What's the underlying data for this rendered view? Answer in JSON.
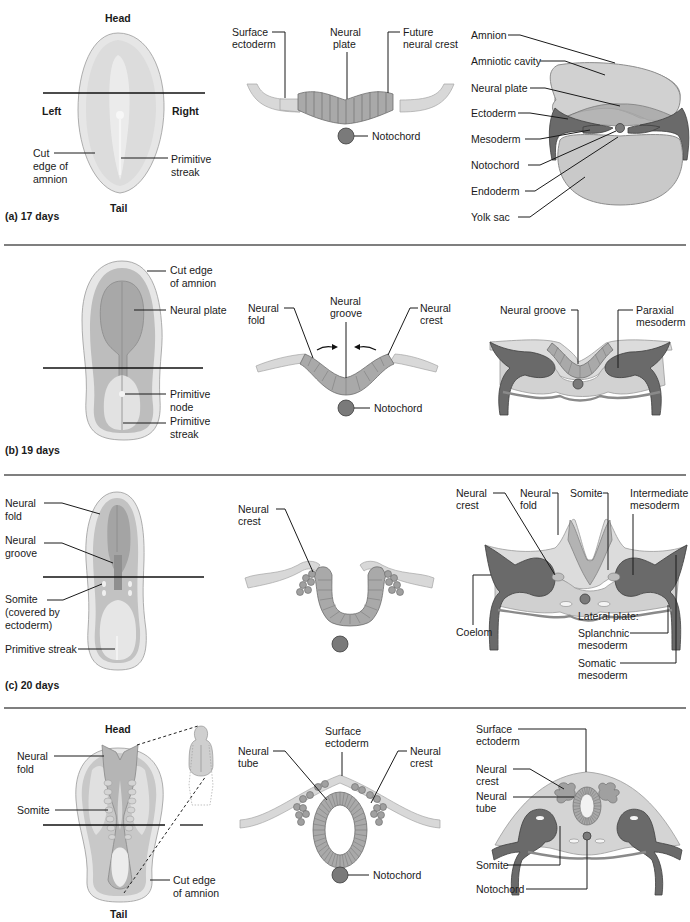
{
  "figure": {
    "panels": [
      {
        "id": "a",
        "caption": "(a) 17 days",
        "dorsal_view": {
          "head": "Head",
          "tail": "Tail",
          "left": "Left",
          "right": "Right",
          "labels": [
            "Cut",
            "edge of",
            "amnion",
            "Primitive",
            "streak"
          ]
        },
        "neural_section": {
          "labels": [
            "Surface",
            "ectoderm",
            "Neural",
            "plate",
            "Future",
            "neural crest",
            "Notochord"
          ]
        },
        "cross_section": {
          "labels": [
            "Amnion",
            "Amniotic cavity",
            "Neural plate",
            "Ectoderm",
            "Mesoderm",
            "Notochord",
            "Endoderm",
            "Yolk sac"
          ]
        }
      },
      {
        "id": "b",
        "caption": "(b) 19 days",
        "dorsal_view": {
          "labels": [
            "Cut edge",
            "of amnion",
            "Neural plate",
            "Primitive",
            "node",
            "Primitive",
            "streak"
          ]
        },
        "neural_section": {
          "labels": [
            "Neural",
            "fold",
            "Neural",
            "groove",
            "Neural",
            "crest",
            "Notochord"
          ]
        },
        "cross_section": {
          "labels": [
            "Neural groove",
            "Paraxial",
            "mesoderm"
          ]
        }
      },
      {
        "id": "c",
        "caption": "(c) 20 days",
        "dorsal_view": {
          "labels": [
            "Neural",
            "fold",
            "Neural",
            "groove",
            "Somite",
            "(covered by",
            "ectoderm)",
            "Primitive streak"
          ]
        },
        "neural_section": {
          "labels": [
            "Neural",
            "crest"
          ]
        },
        "cross_section": {
          "labels": [
            "Neural",
            "crest",
            "Neural",
            "fold",
            "Somite",
            "Intermediate",
            "mesoderm",
            "Coelom",
            "Lateral plate:",
            "Splanchnic",
            "mesoderm",
            "Somatic",
            "mesoderm"
          ]
        }
      },
      {
        "id": "d",
        "caption": "",
        "dorsal_view": {
          "head": "Head",
          "tail": "Tail",
          "labels": [
            "Neural",
            "fold",
            "Somite",
            "Cut edge",
            "of amnion"
          ]
        },
        "neural_section": {
          "labels": [
            "Surface",
            "ectoderm",
            "Neural",
            "tube",
            "Neural",
            "crest",
            "Notochord"
          ]
        },
        "cross_section": {
          "labels": [
            "Surface",
            "ectoderm",
            "Neural",
            "crest",
            "Neural",
            "tube",
            "Somite",
            "Notochord"
          ]
        }
      }
    ]
  }
}
